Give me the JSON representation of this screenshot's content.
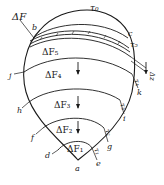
{
  "diagram": {
    "labels": {
      "delta_f": "ΔF",
      "tau_0": "τ₀",
      "tau_5": "τ₅",
      "tau_4": "τ₄",
      "tau_3": "τ₃",
      "tau_2": "τ₂",
      "tau_1": "τ₁",
      "delta_z": "Δz",
      "delta_f5": "ΔF₅",
      "delta_f4": "ΔF₄",
      "delta_f3": "ΔF₃",
      "delta_f2": "ΔF₂",
      "delta_f1": "ΔF₁"
    },
    "points": {
      "a": "a",
      "b": "b",
      "c": "c",
      "d": "d",
      "e": "e",
      "f": "f",
      "g": "g",
      "h": "h",
      "i": "i",
      "j": "j",
      "k": "k"
    },
    "colors": {
      "ink": "#1a1a1a",
      "background": "#ffffff"
    }
  }
}
